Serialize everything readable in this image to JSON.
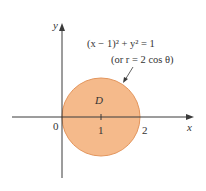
{
  "figure": {
    "equation_line1": "(x − 1)² + y² = 1",
    "equation_line2": "(or r = 2 cos θ)",
    "region_label": "D",
    "axis_labels": {
      "x": "x",
      "y": "y"
    },
    "tick_labels": {
      "origin": "0",
      "one": "1",
      "two": "2"
    },
    "colors": {
      "fill": "#F5BA8B",
      "stroke": "#E3955C",
      "axis": "#3a3a3a"
    }
  }
}
